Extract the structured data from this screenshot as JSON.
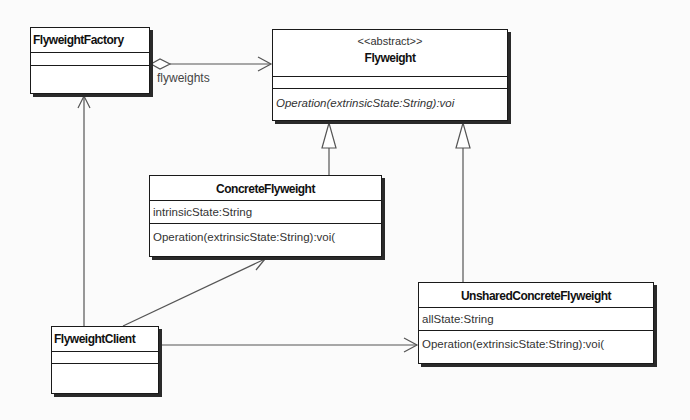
{
  "diagram": {
    "type": "uml-class-diagram",
    "classes": [
      {
        "id": "flyweight_factory",
        "name": "FlyweightFactory",
        "stereotype": null,
        "attributes": [],
        "operations": []
      },
      {
        "id": "flyweight",
        "name": "Flyweight",
        "stereotype": "<<abstract>>",
        "attributes": [],
        "operations": [
          "Operation(extrinsicState:String):voi"
        ]
      },
      {
        "id": "concrete_flyweight",
        "name": "ConcreteFlyweight",
        "stereotype": null,
        "attributes": [
          "intrinsicState:String"
        ],
        "operations": [
          "Operation(extrinsicState:String):voi("
        ]
      },
      {
        "id": "unshared_concrete_flyweight",
        "name": "UnsharedConcreteFlyweight",
        "stereotype": null,
        "attributes": [
          "allState:String"
        ],
        "operations": [
          "Operation(extrinsicState:String):voi("
        ]
      },
      {
        "id": "flyweight_client",
        "name": "FlyweightClient",
        "stereotype": null,
        "attributes": [],
        "operations": []
      }
    ],
    "relationships": [
      {
        "type": "aggregation",
        "from": "FlyweightFactory",
        "to": "Flyweight",
        "label": "flyweights",
        "navigable": true
      },
      {
        "type": "generalization",
        "from": "ConcreteFlyweight",
        "to": "Flyweight"
      },
      {
        "type": "generalization",
        "from": "UnsharedConcreteFlyweight",
        "to": "Flyweight"
      },
      {
        "type": "association",
        "from": "FlyweightClient",
        "to": "FlyweightFactory",
        "navigable": true
      },
      {
        "type": "association",
        "from": "FlyweightClient",
        "to": "ConcreteFlyweight",
        "navigable": true
      },
      {
        "type": "association",
        "from": "FlyweightClient",
        "to": "UnsharedConcreteFlyweight",
        "navigable": true
      }
    ],
    "colors": {
      "background": "#fbfbfb",
      "box_fill": "#ffffff",
      "border": "#1a1a1a",
      "line": "#555555"
    }
  }
}
